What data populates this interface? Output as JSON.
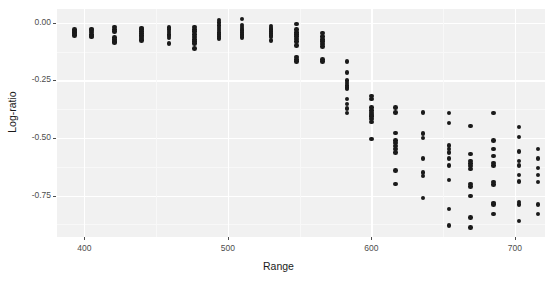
{
  "chart_data": {
    "type": "scatter",
    "title": "",
    "xlabel": "Range",
    "ylabel": "Log-ratio",
    "xlim": [
      381,
      721
    ],
    "ylim": [
      -0.93,
      0.06
    ],
    "xticks": [
      400,
      500,
      600,
      700
    ],
    "xtick_labels": [
      "400",
      "500",
      "600",
      "700"
    ],
    "yticks": [
      0.0,
      -0.25,
      -0.5,
      -0.75
    ],
    "ytick_labels": [
      "0.00",
      "-0.25",
      "-0.50",
      "-0.75"
    ],
    "grid": true,
    "legend": "none",
    "panel_background": "#f1f1f1",
    "grid_color": "#ffffff",
    "point_color": "#1a1a1a",
    "series": [
      {
        "name": "observations",
        "points": [
          [
            393,
            -0.035
          ],
          [
            393,
            -0.042
          ],
          [
            393,
            -0.048
          ],
          [
            393,
            -0.055
          ],
          [
            393,
            -0.028
          ],
          [
            405,
            -0.032
          ],
          [
            405,
            -0.04
          ],
          [
            405,
            -0.05
          ],
          [
            405,
            -0.058
          ],
          [
            405,
            -0.062
          ],
          [
            405,
            -0.026
          ],
          [
            421,
            -0.018
          ],
          [
            421,
            -0.03
          ],
          [
            421,
            -0.038
          ],
          [
            421,
            -0.065
          ],
          [
            421,
            -0.072
          ],
          [
            421,
            -0.08
          ],
          [
            421,
            -0.086
          ],
          [
            440,
            -0.022
          ],
          [
            440,
            -0.03
          ],
          [
            440,
            -0.038
          ],
          [
            440,
            -0.046
          ],
          [
            440,
            -0.054
          ],
          [
            440,
            -0.062
          ],
          [
            440,
            -0.07
          ],
          [
            440,
            -0.078
          ],
          [
            459,
            -0.02
          ],
          [
            459,
            -0.03
          ],
          [
            459,
            -0.04
          ],
          [
            459,
            -0.05
          ],
          [
            459,
            -0.058
          ],
          [
            459,
            -0.066
          ],
          [
            459,
            -0.09
          ],
          [
            477,
            -0.018
          ],
          [
            477,
            -0.028
          ],
          [
            477,
            -0.038
          ],
          [
            477,
            -0.05
          ],
          [
            477,
            -0.062
          ],
          [
            477,
            -0.072
          ],
          [
            477,
            -0.082
          ],
          [
            477,
            -0.09
          ],
          [
            477,
            -0.112
          ],
          [
            494,
            0.012
          ],
          [
            494,
            0.002
          ],
          [
            494,
            -0.012
          ],
          [
            494,
            -0.022
          ],
          [
            494,
            -0.032
          ],
          [
            494,
            -0.042
          ],
          [
            494,
            -0.052
          ],
          [
            494,
            -0.06
          ],
          [
            494,
            -0.068
          ],
          [
            510,
            0.016
          ],
          [
            510,
            -0.01
          ],
          [
            510,
            -0.018
          ],
          [
            510,
            -0.026
          ],
          [
            510,
            -0.034
          ],
          [
            510,
            -0.042
          ],
          [
            510,
            -0.05
          ],
          [
            510,
            -0.058
          ],
          [
            510,
            -0.064
          ],
          [
            530,
            -0.014
          ],
          [
            530,
            -0.022
          ],
          [
            530,
            -0.03
          ],
          [
            530,
            -0.038
          ],
          [
            530,
            -0.046
          ],
          [
            530,
            -0.054
          ],
          [
            530,
            -0.062
          ],
          [
            530,
            -0.078
          ],
          [
            548,
            -0.005
          ],
          [
            548,
            -0.03
          ],
          [
            548,
            -0.042
          ],
          [
            548,
            -0.052
          ],
          [
            548,
            -0.06
          ],
          [
            548,
            -0.07
          ],
          [
            548,
            -0.082
          ],
          [
            548,
            -0.098
          ],
          [
            548,
            -0.148
          ],
          [
            548,
            -0.158
          ],
          [
            548,
            -0.168
          ],
          [
            566,
            -0.045
          ],
          [
            566,
            -0.06
          ],
          [
            566,
            -0.072
          ],
          [
            566,
            -0.082
          ],
          [
            566,
            -0.092
          ],
          [
            566,
            -0.102
          ],
          [
            566,
            -0.16
          ],
          [
            566,
            -0.168
          ],
          [
            583,
            -0.168
          ],
          [
            583,
            -0.215
          ],
          [
            583,
            -0.25
          ],
          [
            583,
            -0.262
          ],
          [
            583,
            -0.272
          ],
          [
            583,
            -0.28
          ],
          [
            583,
            -0.288
          ],
          [
            583,
            -0.33
          ],
          [
            583,
            -0.352
          ],
          [
            583,
            -0.372
          ],
          [
            583,
            -0.392
          ],
          [
            600,
            -0.318
          ],
          [
            600,
            -0.33
          ],
          [
            600,
            -0.368
          ],
          [
            600,
            -0.382
          ],
          [
            600,
            -0.392
          ],
          [
            600,
            -0.4
          ],
          [
            600,
            -0.408
          ],
          [
            600,
            -0.418
          ],
          [
            600,
            -0.43
          ],
          [
            600,
            -0.505
          ],
          [
            617,
            -0.368
          ],
          [
            617,
            -0.39
          ],
          [
            617,
            -0.478
          ],
          [
            617,
            -0.512
          ],
          [
            617,
            -0.522
          ],
          [
            617,
            -0.534
          ],
          [
            617,
            -0.548
          ],
          [
            617,
            -0.562
          ],
          [
            617,
            -0.642
          ],
          [
            617,
            -0.7
          ],
          [
            636,
            -0.39
          ],
          [
            636,
            -0.48
          ],
          [
            636,
            -0.5
          ],
          [
            636,
            -0.59
          ],
          [
            636,
            -0.65
          ],
          [
            636,
            -0.665
          ],
          [
            636,
            -0.76
          ],
          [
            654,
            -0.392
          ],
          [
            654,
            -0.435
          ],
          [
            654,
            -0.532
          ],
          [
            654,
            -0.548
          ],
          [
            654,
            -0.562
          ],
          [
            654,
            -0.59
          ],
          [
            654,
            -0.62
          ],
          [
            654,
            -0.682
          ],
          [
            654,
            -0.808
          ],
          [
            654,
            -0.88
          ],
          [
            669,
            -0.448
          ],
          [
            669,
            -0.57
          ],
          [
            669,
            -0.6
          ],
          [
            669,
            -0.612
          ],
          [
            669,
            -0.622
          ],
          [
            669,
            -0.635
          ],
          [
            669,
            -0.7
          ],
          [
            669,
            -0.712
          ],
          [
            669,
            -0.752
          ],
          [
            669,
            -0.845
          ],
          [
            669,
            -0.888
          ],
          [
            685,
            -0.392
          ],
          [
            685,
            -0.51
          ],
          [
            685,
            -0.548
          ],
          [
            685,
            -0.578
          ],
          [
            685,
            -0.608
          ],
          [
            685,
            -0.62
          ],
          [
            685,
            -0.692
          ],
          [
            685,
            -0.702
          ],
          [
            685,
            -0.782
          ],
          [
            685,
            -0.788
          ],
          [
            685,
            -0.83
          ],
          [
            703,
            -0.452
          ],
          [
            703,
            -0.495
          ],
          [
            703,
            -0.56
          ],
          [
            703,
            -0.6
          ],
          [
            703,
            -0.62
          ],
          [
            703,
            -0.66
          ],
          [
            703,
            -0.688
          ],
          [
            703,
            -0.778
          ],
          [
            703,
            -0.79
          ],
          [
            703,
            -0.86
          ],
          [
            716,
            -0.548
          ],
          [
            716,
            -0.588
          ],
          [
            716,
            -0.63
          ],
          [
            716,
            -0.66
          ],
          [
            716,
            -0.692
          ],
          [
            716,
            -0.79
          ],
          [
            716,
            -0.83
          ]
        ]
      }
    ]
  }
}
